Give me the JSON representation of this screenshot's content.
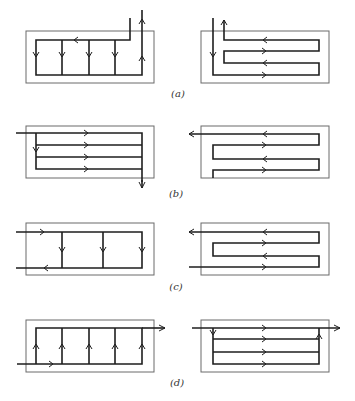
{
  "figure": {
    "panels": [
      {
        "id": "a",
        "label": "(a)",
        "label_pos": [
          178,
          94
        ]
      },
      {
        "id": "b",
        "label": "(b)",
        "label_pos": [
          176,
          194
        ]
      },
      {
        "id": "c",
        "label": "(c)",
        "label_pos": [
          176,
          287
        ]
      },
      {
        "id": "d",
        "label": "(d)",
        "label_pos": [
          177,
          383
        ]
      }
    ],
    "colors": {
      "line": "#1e1e1e",
      "box": "#6a6a6a",
      "background": "#ffffff"
    }
  }
}
